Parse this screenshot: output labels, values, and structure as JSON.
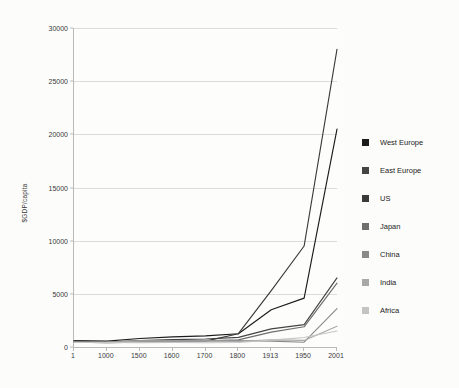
{
  "chart_data": {
    "type": "line",
    "title": "",
    "xlabel": "",
    "ylabel": "$GDP/capita",
    "categories": [
      "1",
      "1000",
      "1500",
      "1600",
      "1700",
      "1800",
      "1913",
      "1950",
      "2001"
    ],
    "ylim": [
      0,
      30000
    ],
    "y_ticks": [
      "0",
      "5000",
      "10000",
      "15000",
      "20000",
      "25000",
      "30000"
    ],
    "y_tick_values": [
      0,
      5000,
      10000,
      15000,
      20000,
      25000,
      30000
    ],
    "grid": true,
    "legend_position": "right",
    "series": [
      {
        "name": "West Europe",
        "color": "#1c1c1c",
        "values": [
          600,
          550,
          800,
          950,
          1050,
          1250,
          3500,
          4600,
          20500
        ]
      },
      {
        "name": "East Europe",
        "color": "#444444",
        "values": [
          550,
          450,
          600,
          700,
          750,
          900,
          1700,
          2100,
          6500
        ]
      },
      {
        "name": "US",
        "color": "#3a3a3a",
        "values": [
          450,
          400,
          450,
          500,
          550,
          1250,
          5300,
          9500,
          28000
        ]
      },
      {
        "name": "Japan",
        "color": "#6e6e6e",
        "values": [
          450,
          430,
          500,
          520,
          570,
          670,
          1400,
          1900,
          6000
        ]
      },
      {
        "name": "China",
        "color": "#8a8a8a",
        "values": [
          450,
          470,
          600,
          600,
          600,
          600,
          550,
          450,
          3600
        ]
      },
      {
        "name": "India",
        "color": "#a8a8a8",
        "values": [
          450,
          450,
          550,
          550,
          550,
          530,
          670,
          620,
          1950
        ]
      },
      {
        "name": "Africa",
        "color": "#c4c4c4",
        "values": [
          430,
          420,
          410,
          420,
          400,
          420,
          640,
          890,
          1500
        ]
      }
    ]
  }
}
